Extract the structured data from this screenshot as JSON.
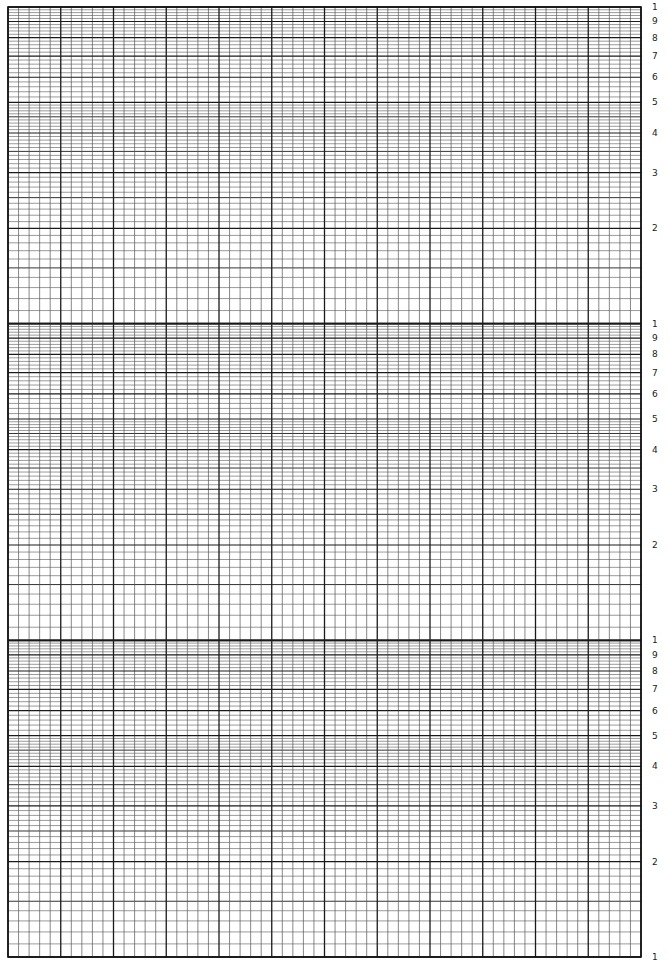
{
  "sheet": {
    "type": "semi-logarithmic graph paper",
    "log_axis": "vertical",
    "decades": 3,
    "linear_major_divisions": 12,
    "linear_minor_per_major": 5,
    "decade_labels": [
      "1",
      "2",
      "3",
      "4",
      "5",
      "6",
      "7",
      "8",
      "9",
      "1"
    ],
    "bottom_label": "1",
    "colors": {
      "major": "#1a1a1a",
      "minor": "#555555",
      "paper": "#ffffff"
    }
  }
}
